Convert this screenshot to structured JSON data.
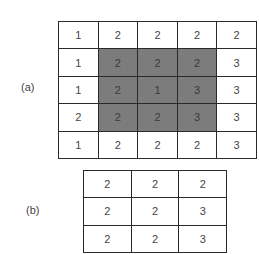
{
  "figure_a": {
    "label": "(a)",
    "shaded_region": {
      "rows": [
        1,
        3
      ],
      "cols": [
        1,
        3
      ]
    },
    "shade_color": "#7c7c7c",
    "rows": [
      [
        "1",
        "2",
        "2",
        "2",
        "2"
      ],
      [
        "1",
        "2",
        "2",
        "2",
        "3"
      ],
      [
        "1",
        "2",
        "1",
        "3",
        "3"
      ],
      [
        "2",
        "2",
        "2",
        "3",
        "3"
      ],
      [
        "1",
        "2",
        "2",
        "2",
        "3"
      ]
    ]
  },
  "figure_b": {
    "label": "(b)",
    "rows": [
      [
        "2",
        "2",
        "2"
      ],
      [
        "2",
        "2",
        "3"
      ],
      [
        "2",
        "2",
        "3"
      ]
    ]
  }
}
